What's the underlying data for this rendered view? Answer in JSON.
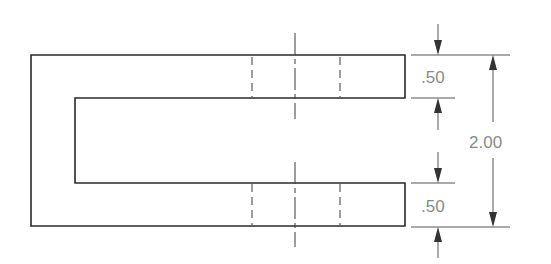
{
  "drawing": {
    "type": "U-channel orthographic view",
    "dimensions": {
      "top_flange_thickness": ".50",
      "bottom_flange_thickness": ".50",
      "overall_height": "2.00"
    },
    "colors": {
      "object_line": "#2a2a2a",
      "dimension_text": "#8a8a8a",
      "background": "#ffffff"
    }
  }
}
